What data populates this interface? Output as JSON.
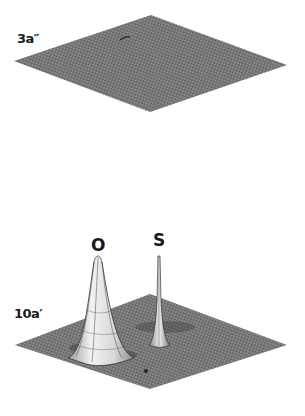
{
  "figure": {
    "panels": [
      {
        "id": "3a-double-prime",
        "label": "3a″",
        "description": "flat surface plot, no peaks"
      },
      {
        "id": "10a-prime",
        "label": "10a′",
        "peaks": [
          {
            "label": "O",
            "shape": "broad"
          },
          {
            "label": "S",
            "shape": "narrow"
          }
        ]
      }
    ]
  },
  "colors": {
    "surface": "#7a7a7a",
    "mesh": "#3c3c3c",
    "peak_fill": "#e6e6e6",
    "text": "#1a1a1a",
    "background": "#ffffff"
  }
}
